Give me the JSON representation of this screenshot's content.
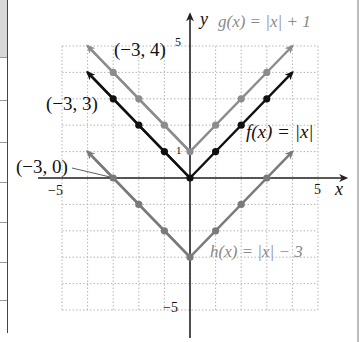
{
  "chart_data": {
    "type": "line",
    "title": "",
    "xlabel": "x",
    "ylabel": "y",
    "xlim": [
      -5,
      5
    ],
    "ylim": [
      -5,
      5
    ],
    "grid": true,
    "x_ticks": [
      {
        "value": -5,
        "label": "−5"
      },
      {
        "value": 5,
        "label": "5"
      }
    ],
    "y_ticks": [
      {
        "value": 5,
        "label": "5"
      },
      {
        "value": 1,
        "label": "1"
      },
      {
        "value": -5,
        "label": "−5"
      }
    ],
    "series": [
      {
        "name": "g(x) = |x| + 1",
        "color": "#8c8c8c",
        "x": [
          -3,
          -2,
          -1,
          0,
          1,
          2,
          3
        ],
        "values": [
          4,
          3,
          2,
          1,
          2,
          3,
          4
        ]
      },
      {
        "name": "f(x) = |x|",
        "color": "#111111",
        "x": [
          -3,
          -2,
          -1,
          0,
          1,
          2,
          3
        ],
        "values": [
          3,
          2,
          1,
          0,
          1,
          2,
          3
        ]
      },
      {
        "name": "h(x) = |x| − 3",
        "color": "#7a7a7a",
        "x": [
          -3,
          -2,
          -1,
          0,
          1,
          2,
          3
        ],
        "values": [
          0,
          -1,
          -2,
          -3,
          -2,
          -1,
          0
        ]
      }
    ],
    "annotations": [
      {
        "text": "(−3, 4)",
        "point": [
          -3,
          4
        ]
      },
      {
        "text": "(−3, 3)",
        "point": [
          -3,
          3
        ]
      },
      {
        "text": "(−3, 0)",
        "point": [
          -3,
          0
        ]
      }
    ]
  },
  "labels": {
    "g": "g(x) = |x| + 1",
    "f": "f(x) = |x|",
    "h": "h(x) = |x| − 3",
    "x_axis": "x",
    "y_axis": "y",
    "tick_x_neg5": "−5",
    "tick_x_5": "5",
    "tick_y_5": "5",
    "tick_y_1": "1",
    "tick_y_neg5": "−5",
    "pt_g": "(−3, 4)",
    "pt_f": "(−3, 3)",
    "pt_h": "(−3, 0)"
  },
  "colors": {
    "grid": "#b5b5b5",
    "axis": "#222222",
    "f": "#111111",
    "g": "#8c8c8c",
    "h": "#7a7a7a"
  }
}
